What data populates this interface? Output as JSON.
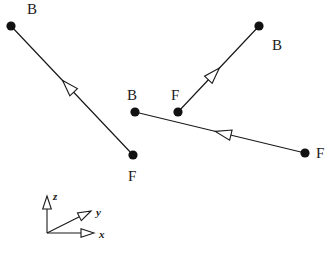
{
  "figure": {
    "background_color": "#ffffff",
    "stroke_color": "#1a1a1a",
    "node_fill_color": "#111111",
    "width": 332,
    "height": 254
  },
  "nodes": [
    {
      "id": "n1",
      "label": "B",
      "type": "back",
      "cx": 11,
      "cy": 26,
      "label_x": 27,
      "label_y": 2
    },
    {
      "id": "n2",
      "label": "F",
      "type": "front",
      "cx": 133,
      "cy": 155,
      "label_x": 128,
      "label_y": 169
    },
    {
      "id": "n3",
      "label": "B",
      "type": "back",
      "cx": 135,
      "cy": 112,
      "label_x": 127,
      "label_y": 88
    },
    {
      "id": "n4",
      "label": "F",
      "type": "front",
      "cx": 178,
      "cy": 112,
      "label_x": 171,
      "label_y": 88
    },
    {
      "id": "n5",
      "label": "B",
      "type": "back",
      "cx": 259,
      "cy": 26,
      "label_x": 272,
      "label_y": 38
    },
    {
      "id": "n6",
      "label": "F",
      "type": "front",
      "cx": 305,
      "cy": 153,
      "label_x": 316,
      "label_y": 146
    }
  ],
  "segments": [
    {
      "id": "s1",
      "from": "n1",
      "to": "n2",
      "x1": 11,
      "y1": 26,
      "x2": 133,
      "y2": 155,
      "arrow_t": 0.47,
      "arrow_toward": "from"
    },
    {
      "id": "s2",
      "from": "n4",
      "to": "n5",
      "x1": 178,
      "y1": 112,
      "x2": 259,
      "y2": 26,
      "arrow_t": 0.44,
      "arrow_toward": "to"
    },
    {
      "id": "s3",
      "from": "n3",
      "to": "n6",
      "x1": 135,
      "y1": 112,
      "x2": 305,
      "y2": 153,
      "arrow_t": 0.52,
      "arrow_toward": "from"
    }
  ],
  "axis_triad": {
    "origin_x": 47,
    "origin_y": 233,
    "axes": [
      {
        "id": "z",
        "label": "z",
        "tip_x": 47,
        "tip_y": 196,
        "label_x": 53,
        "label_y": 191
      },
      {
        "id": "y",
        "label": "y",
        "tip_x": 91,
        "tip_y": 211,
        "label_x": 96,
        "label_y": 207
      },
      {
        "id": "x",
        "label": "x",
        "tip_x": 94,
        "tip_y": 233,
        "label_x": 99,
        "label_y": 229
      }
    ]
  }
}
